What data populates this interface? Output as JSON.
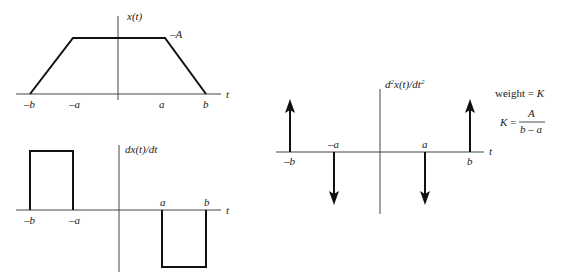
{
  "plot_x": {
    "ylabel": "x(t)",
    "xlabel": "t",
    "level_label": "–A",
    "ticks": [
      "–b",
      "–a",
      "a",
      "b"
    ]
  },
  "plot_dx": {
    "ylabel": "dx(t)/dt",
    "xlabel": "t",
    "ticks_below": [
      "–b",
      "–a"
    ],
    "ticks_above": [
      "a",
      "b"
    ]
  },
  "plot_d2x": {
    "ylabel_main": "d",
    "ylabel_sup1": "2",
    "ylabel_mid": "x(t)/dt",
    "ylabel_sup2": "2",
    "xlabel": "t",
    "ticks_below": [
      "–b",
      "b"
    ],
    "ticks_above": [
      "–a",
      "a"
    ]
  },
  "annotation": {
    "weight_text": "weight = ",
    "weight_var": "K",
    "k_lhs": "K",
    "k_eq": " = ",
    "numerator": "A",
    "denominator": "b – a"
  }
}
